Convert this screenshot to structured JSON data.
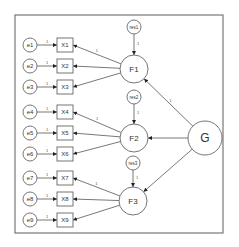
{
  "diagram": {
    "type": "bifactor-sem-path-diagram",
    "general_factor": {
      "id": "G",
      "label": "G"
    },
    "group_factors": [
      {
        "id": "F1",
        "label": "F1",
        "residual": "res1",
        "indicators": [
          "X1",
          "X2",
          "X3"
        ]
      },
      {
        "id": "F2",
        "label": "F2",
        "residual": "res2",
        "indicators": [
          "X4",
          "X5",
          "X6"
        ]
      },
      {
        "id": "F3",
        "label": "F3",
        "residual": "res3",
        "indicators": [
          "X7",
          "X8",
          "X9"
        ]
      }
    ],
    "indicators": [
      {
        "label": "X1",
        "error": "e1"
      },
      {
        "label": "X2",
        "error": "e2"
      },
      {
        "label": "X3",
        "error": "e3"
      },
      {
        "label": "X4",
        "error": "e4"
      },
      {
        "label": "X5",
        "error": "e5"
      },
      {
        "label": "X6",
        "error": "e6"
      },
      {
        "label": "X7",
        "error": "e7"
      },
      {
        "label": "X8",
        "error": "e8"
      },
      {
        "label": "X9",
        "error": "e9"
      }
    ],
    "path_fixed_label": "1"
  }
}
